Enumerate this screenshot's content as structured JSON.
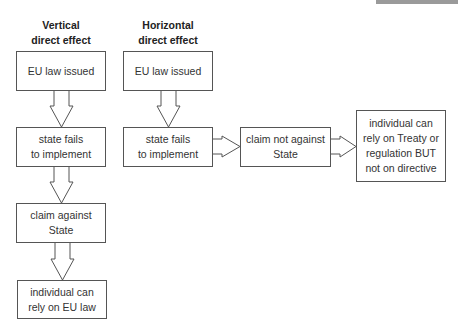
{
  "columns": {
    "vertical": {
      "heading": "Vertical\ndirect effect",
      "heading_lines": [
        "Vertical",
        "direct effect"
      ],
      "steps": [
        "EU law issued",
        "state fails\nto implement",
        "claim against\nState",
        "individual can\nrely on EU law"
      ]
    },
    "horizontal": {
      "heading_lines": [
        "Horizontal",
        "direct effect"
      ],
      "steps": [
        "EU law issued",
        "state fails\nto implement",
        "claim not against\nState",
        "individual can\nrely on Treaty or\nregulation BUT\nnot on directive"
      ]
    }
  },
  "text": {
    "v_head_1": "Vertical",
    "v_head_2": "direct effect",
    "h_head_1": "Horizontal",
    "h_head_2": "direct effect",
    "v_box1": "EU law issued",
    "v_box2_1": "state fails",
    "v_box2_2": "to implement",
    "v_box3_1": "claim against",
    "v_box3_2": "State",
    "v_box4_1": "individual can",
    "v_box4_2": "rely on EU law",
    "h_box1": "EU law issued",
    "h_box2_1": "state fails",
    "h_box2_2": "to implement",
    "h_box3_1": "claim not against",
    "h_box3_2": "State",
    "h_box4_1": "individual can",
    "h_box4_2": "rely on Treaty or",
    "h_box4_3": "regulation BUT",
    "h_box4_4": "not on directive"
  },
  "colors": {
    "border": "#555555",
    "topbar": "#9a9a9a"
  }
}
